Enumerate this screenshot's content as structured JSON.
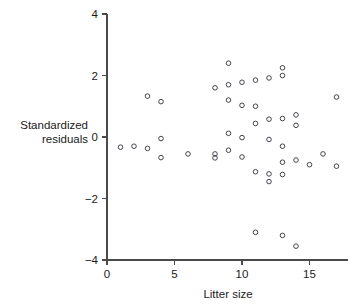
{
  "chart_data": {
    "type": "scatter",
    "title": "",
    "xlabel": "Litter size",
    "ylabel": "Standardized residuals",
    "ylabel_lines": [
      "Standardized",
      "residuals"
    ],
    "xlim": [
      0,
      17.7
    ],
    "ylim": [
      -4,
      4
    ],
    "xticks": [
      0,
      5,
      10,
      15
    ],
    "xticklabels": [
      "0",
      "5",
      "10",
      "15"
    ],
    "yticks": [
      -4,
      -2,
      0,
      2,
      4
    ],
    "yticklabels": [
      "-4",
      "-2",
      "0",
      "2",
      "4"
    ],
    "grid": false,
    "legend": null,
    "marker": "open-circle",
    "marker_color": "#3c3c46",
    "axis_color": "#4a4a4a",
    "points": [
      {
        "x": 1,
        "y": -0.33
      },
      {
        "x": 2,
        "y": -0.3
      },
      {
        "x": 3,
        "y": -0.37
      },
      {
        "x": 3,
        "y": 1.33
      },
      {
        "x": 4,
        "y": 1.15
      },
      {
        "x": 4,
        "y": -0.05
      },
      {
        "x": 4,
        "y": -0.67
      },
      {
        "x": 6,
        "y": -0.55
      },
      {
        "x": 8,
        "y": 1.6
      },
      {
        "x": 8,
        "y": -0.55
      },
      {
        "x": 8,
        "y": -0.68
      },
      {
        "x": 9,
        "y": 2.4
      },
      {
        "x": 9,
        "y": 1.7
      },
      {
        "x": 9,
        "y": 1.2
      },
      {
        "x": 9,
        "y": 0.12
      },
      {
        "x": 9,
        "y": -0.43
      },
      {
        "x": 10,
        "y": 1.78
      },
      {
        "x": 10,
        "y": 1.03
      },
      {
        "x": 10,
        "y": -0.02
      },
      {
        "x": 10,
        "y": -0.65
      },
      {
        "x": 11,
        "y": 1.85
      },
      {
        "x": 11,
        "y": 1.0
      },
      {
        "x": 11,
        "y": 0.44
      },
      {
        "x": 11,
        "y": -1.13
      },
      {
        "x": 11,
        "y": -3.1
      },
      {
        "x": 12,
        "y": 1.92
      },
      {
        "x": 12,
        "y": 0.58
      },
      {
        "x": 12,
        "y": -0.08
      },
      {
        "x": 12,
        "y": -1.2
      },
      {
        "x": 12,
        "y": -1.45
      },
      {
        "x": 13,
        "y": 2.25
      },
      {
        "x": 13,
        "y": 2.0
      },
      {
        "x": 13,
        "y": 0.6
      },
      {
        "x": 13,
        "y": -0.3
      },
      {
        "x": 13,
        "y": -0.82
      },
      {
        "x": 13,
        "y": -1.22
      },
      {
        "x": 13,
        "y": -3.2
      },
      {
        "x": 14,
        "y": 0.72
      },
      {
        "x": 14,
        "y": 0.38
      },
      {
        "x": 14,
        "y": -0.75
      },
      {
        "x": 14,
        "y": -3.55
      },
      {
        "x": 15,
        "y": -0.9
      },
      {
        "x": 16,
        "y": -0.55
      },
      {
        "x": 17,
        "y": 1.3
      },
      {
        "x": 17,
        "y": -0.95
      }
    ]
  }
}
